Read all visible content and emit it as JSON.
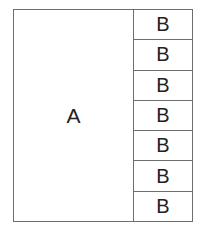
{
  "diagram": {
    "main_pane": {
      "label": "A"
    },
    "side_cells": [
      {
        "label": "B"
      },
      {
        "label": "B"
      },
      {
        "label": "B"
      },
      {
        "label": "B"
      },
      {
        "label": "B"
      },
      {
        "label": "B"
      },
      {
        "label": "B"
      }
    ]
  }
}
